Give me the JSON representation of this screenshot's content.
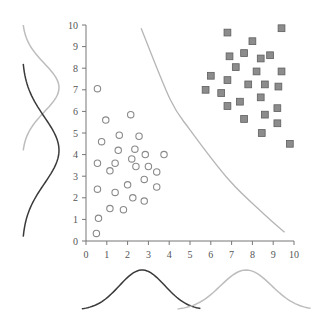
{
  "chart_data": {
    "type": "scatter",
    "title": "",
    "xlabel": "",
    "ylabel": "",
    "xlim": [
      0,
      10
    ],
    "ylim": [
      0,
      10
    ],
    "grid": false,
    "legend": null,
    "x_ticks": [
      "0",
      "1",
      "2",
      "3",
      "4",
      "5",
      "6",
      "7",
      "8",
      "9",
      "10"
    ],
    "y_ticks": [
      "0",
      "1",
      "2",
      "3",
      "4",
      "5",
      "6",
      "7",
      "8",
      "9",
      "10"
    ],
    "series": [
      {
        "name": "class-circles",
        "marker": "open-circle",
        "color": "#8a8a8a",
        "points": [
          [
            0.5,
            0.35
          ],
          [
            0.6,
            1.05
          ],
          [
            0.55,
            2.4
          ],
          [
            0.55,
            3.6
          ],
          [
            0.75,
            4.6
          ],
          [
            1.15,
            1.5
          ],
          [
            1.4,
            2.25
          ],
          [
            1.15,
            3.25
          ],
          [
            1.4,
            3.6
          ],
          [
            1.55,
            4.2
          ],
          [
            1.6,
            4.9
          ],
          [
            1.8,
            1.45
          ],
          [
            2.0,
            2.6
          ],
          [
            2.25,
            2.0
          ],
          [
            2.2,
            3.8
          ],
          [
            2.35,
            4.25
          ],
          [
            2.4,
            3.45
          ],
          [
            2.55,
            4.85
          ],
          [
            2.8,
            1.85
          ],
          [
            2.8,
            2.85
          ],
          [
            2.85,
            4.0
          ],
          [
            3.0,
            3.45
          ],
          [
            3.4,
            3.2
          ],
          [
            3.4,
            2.5
          ],
          [
            3.75,
            4.0
          ],
          [
            0.55,
            7.05
          ],
          [
            0.95,
            5.6
          ],
          [
            2.15,
            5.85
          ]
        ]
      },
      {
        "name": "class-squares",
        "marker": "filled-square",
        "color": "#8c8c8c",
        "points": [
          [
            6.8,
            9.65
          ],
          [
            9.4,
            9.85
          ],
          [
            8.0,
            9.25
          ],
          [
            6.9,
            8.55
          ],
          [
            7.6,
            8.7
          ],
          [
            8.4,
            8.45
          ],
          [
            8.85,
            8.6
          ],
          [
            7.2,
            8.05
          ],
          [
            8.2,
            7.85
          ],
          [
            9.4,
            7.85
          ],
          [
            6.0,
            7.65
          ],
          [
            6.8,
            7.45
          ],
          [
            7.8,
            7.25
          ],
          [
            8.6,
            7.25
          ],
          [
            9.25,
            7.15
          ],
          [
            5.75,
            7.0
          ],
          [
            6.5,
            6.85
          ],
          [
            8.4,
            6.65
          ],
          [
            7.4,
            6.45
          ],
          [
            6.8,
            6.25
          ],
          [
            9.2,
            6.15
          ],
          [
            7.6,
            5.65
          ],
          [
            8.6,
            5.85
          ],
          [
            9.2,
            5.45
          ],
          [
            8.45,
            5.0
          ],
          [
            9.8,
            4.5
          ]
        ]
      }
    ],
    "decision_boundary": {
      "color": "#b5b5b5",
      "points": [
        [
          2.65,
          9.85
        ],
        [
          4.05,
          6.55
        ],
        [
          5.0,
          5.15
        ],
        [
          6.9,
          2.8
        ],
        [
          8.5,
          1.3
        ],
        [
          9.55,
          0.4
        ]
      ]
    },
    "marginals": {
      "left": [
        {
          "name": "squares-y-density",
          "color": "#bdbdbd",
          "mean_y": 7.1,
          "range_y": [
            4.2,
            10.0
          ]
        },
        {
          "name": "circles-y-density",
          "color": "#3a3a3a",
          "mean_y": 4.2,
          "range_y": [
            0.2,
            8.2
          ]
        }
      ],
      "bottom": [
        {
          "name": "circles-x-density",
          "color": "#3a3a3a",
          "mean_x": 2.7,
          "range_x": [
            -0.2,
            5.5
          ]
        },
        {
          "name": "squares-x-density",
          "color": "#bdbdbd",
          "mean_x": 7.7,
          "range_x": [
            4.4,
            10.8
          ]
        }
      ]
    }
  },
  "layout": {
    "origin_px": [
      86,
      241
    ],
    "x_max_px": 294,
    "y_max_px": 25
  }
}
